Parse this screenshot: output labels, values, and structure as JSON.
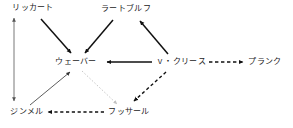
{
  "figure": {
    "type": "influence-diagram",
    "background_color": "#ffffff",
    "text_color": "#1a1a1a",
    "width": 293,
    "height": 128
  },
  "nodes": [
    {
      "id": "rickert",
      "label": "リッカート",
      "x": 33,
      "y": 8
    },
    {
      "id": "radbruch",
      "label": "ラートブルフ",
      "x": 126,
      "y": 9
    },
    {
      "id": "weber",
      "label": "ウェーバー",
      "x": 76,
      "y": 62
    },
    {
      "id": "kries",
      "label": "ｖ・クリース",
      "x": 181,
      "y": 62
    },
    {
      "id": "planck",
      "label": "プランク",
      "x": 265,
      "y": 62
    },
    {
      "id": "simmel",
      "label": "ジンメル",
      "x": 27,
      "y": 112
    },
    {
      "id": "husserl",
      "label": "フッサール",
      "x": 129,
      "y": 112
    }
  ],
  "edges": [
    {
      "id": "rickert-to-weber",
      "from": "rickert",
      "to": "weber",
      "style": "solid",
      "weight": "bold",
      "heads": "single",
      "color": "#111111"
    },
    {
      "id": "radbruch-to-weber",
      "from": "radbruch",
      "to": "weber",
      "style": "solid",
      "weight": "bold",
      "heads": "single",
      "color": "#111111"
    },
    {
      "id": "kries-to-radbruch",
      "from": "kries",
      "to": "radbruch",
      "style": "solid",
      "weight": "bold",
      "heads": "single",
      "color": "#111111"
    },
    {
      "id": "kries-to-weber",
      "from": "kries",
      "to": "weber",
      "style": "solid",
      "weight": "bold",
      "heads": "single",
      "color": "#111111"
    },
    {
      "id": "kries-to-planck",
      "from": "kries",
      "to": "planck",
      "style": "dashed",
      "weight": "bold",
      "heads": "single",
      "color": "#111111"
    },
    {
      "id": "rickert-simmel",
      "from": "rickert",
      "to": "simmel",
      "style": "solid",
      "weight": "thin",
      "heads": "double",
      "color": "#555555"
    },
    {
      "id": "simmel-to-weber",
      "from": "simmel",
      "to": "weber",
      "style": "solid",
      "weight": "thin",
      "heads": "single",
      "color": "#333333"
    },
    {
      "id": "husserl-to-simmel",
      "from": "husserl",
      "to": "simmel",
      "style": "dashed",
      "weight": "bold",
      "heads": "single",
      "color": "#111111"
    },
    {
      "id": "weber-to-husserl",
      "from": "weber",
      "to": "husserl",
      "style": "dotted",
      "weight": "thin",
      "heads": "single",
      "color": "#bbbbbb"
    },
    {
      "id": "husserl-up-to-kries",
      "from": "husserl",
      "to": "kries",
      "style": "dashed",
      "weight": "bold",
      "heads": "single",
      "color": "#111111"
    }
  ]
}
